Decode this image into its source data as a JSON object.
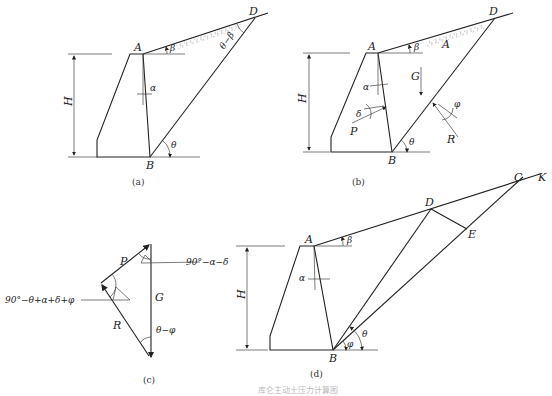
{
  "figure": {
    "caption": "库仑主动土压力计算图",
    "panels": {
      "a": {
        "caption": "(a)",
        "labels": {
          "A": "A",
          "B": "B",
          "D": "D",
          "H": "H",
          "alpha": "α",
          "beta": "β",
          "theta": "θ",
          "theta_minus_beta": "θ−β"
        }
      },
      "b": {
        "caption": "(b)",
        "labels": {
          "A": "A",
          "B": "B",
          "D": "D",
          "H": "H",
          "G": "G",
          "P": "P",
          "R": "R",
          "alpha": "α",
          "beta": "β",
          "theta": "θ",
          "delta": "δ",
          "phi": "φ",
          "wedge": "A"
        }
      },
      "c": {
        "caption": "(c)",
        "labels": {
          "P": "P",
          "G": "G",
          "R": "R",
          "angle_top": "90°−α−δ",
          "angle_left": "90°−θ+α+δ+φ",
          "angle_bottom": "θ−φ"
        }
      },
      "d": {
        "caption": "(d)",
        "labels": {
          "A": "A",
          "B": "B",
          "C": "C",
          "D": "D",
          "E": "E",
          "K": "K",
          "H": "H",
          "alpha": "α",
          "beta": "β",
          "theta": "θ",
          "phi": "φ"
        }
      }
    }
  }
}
